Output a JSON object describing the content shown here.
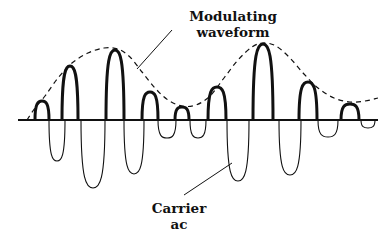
{
  "diagram": {
    "labels": {
      "modulating": {
        "line1": "Modulating",
        "line2": "waveform"
      },
      "carrier": {
        "line1": "Carrier",
        "line2": "ac"
      }
    },
    "colors": {
      "ink": "#111111",
      "background": "#ffffff"
    },
    "baseline": {
      "x1": 18,
      "x2": 378,
      "y": 120
    },
    "peaks": [
      {
        "x": 42,
        "y": 101,
        "hw": 7
      },
      {
        "x": 70,
        "y": 66,
        "hw": 8
      },
      {
        "x": 115,
        "y": 50,
        "hw": 9
      },
      {
        "x": 150,
        "y": 92,
        "hw": 8
      },
      {
        "x": 182,
        "y": 107,
        "hw": 7
      },
      {
        "x": 217,
        "y": 87,
        "hw": 9
      },
      {
        "x": 263,
        "y": 44,
        "hw": 10
      },
      {
        "x": 308,
        "y": 82,
        "hw": 9
      },
      {
        "x": 350,
        "y": 104,
        "hw": 9
      }
    ],
    "troughs": [
      {
        "x": 57,
        "y": 161,
        "hw": 8
      },
      {
        "x": 93,
        "y": 188,
        "hw": 12
      },
      {
        "x": 134,
        "y": 174,
        "hw": 10
      },
      {
        "x": 167,
        "y": 138,
        "hw": 9
      },
      {
        "x": 198,
        "y": 138,
        "hw": 8
      },
      {
        "x": 238,
        "y": 181,
        "hw": 11
      },
      {
        "x": 290,
        "y": 175,
        "hw": 11
      },
      {
        "x": 328,
        "y": 137,
        "hw": 10
      },
      {
        "x": 368,
        "y": 128,
        "hw": 7
      }
    ],
    "envelope_points": [
      [
        27,
        120
      ],
      [
        35,
        108
      ],
      [
        45,
        96
      ],
      [
        58,
        78
      ],
      [
        72,
        63
      ],
      [
        88,
        53
      ],
      [
        104,
        48
      ],
      [
        118,
        49
      ],
      [
        130,
        57
      ],
      [
        142,
        72
      ],
      [
        155,
        88
      ],
      [
        168,
        100
      ],
      [
        182,
        106
      ],
      [
        196,
        105
      ],
      [
        210,
        96
      ],
      [
        224,
        78
      ],
      [
        238,
        60
      ],
      [
        252,
        47
      ],
      [
        263,
        43
      ],
      [
        276,
        46
      ],
      [
        290,
        58
      ],
      [
        304,
        74
      ],
      [
        318,
        88
      ],
      [
        334,
        98
      ],
      [
        350,
        102
      ],
      [
        365,
        101
      ],
      [
        378,
        98
      ]
    ]
  }
}
